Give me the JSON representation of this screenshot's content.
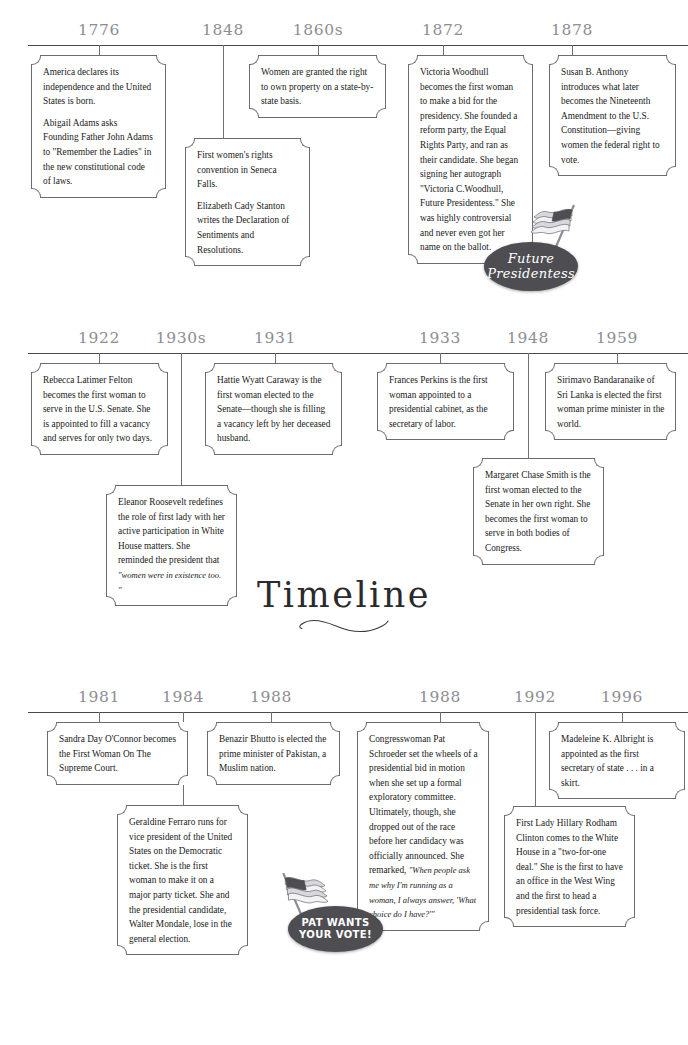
{
  "title": {
    "text": "Timeline"
  },
  "rows": [
    {
      "name": "row-1",
      "years": [
        "1776",
        "1848",
        "1860s",
        "1872",
        "1878"
      ],
      "entries": [
        {
          "name": "entry-1776",
          "paragraphs": [
            "America declares its independence and the United States is born.",
            "Abigail Adams asks Founding Father John Adams to \"Remember the Ladies\" in the new constitutional code of laws."
          ]
        },
        {
          "name": "entry-1848",
          "paragraphs": [
            "First women's rights convention in Seneca Falls.",
            "Elizabeth Cady Stanton writes the Declaration of Sentiments and Resolutions."
          ]
        },
        {
          "name": "entry-1860s",
          "paragraphs": [
            "Women are granted the right to own property on a state-by-state basis."
          ]
        },
        {
          "name": "entry-1872",
          "paragraphs": [
            "Victoria Woodhull becomes the first woman to make a bid for the presidency. She founded a reform party, the Equal Rights Party, and ran as their candidate. She began signing her autograph \"Victoria C.Woodhull, Future Presidentess.\" She was highly controversial and never even got her name on the ballot."
          ]
        },
        {
          "name": "entry-1878",
          "paragraphs": [
            "Susan B. Anthony introduces what later becomes the Nineteenth Amendment to the U.S. Constitution—giving women the federal right to vote."
          ]
        }
      ]
    },
    {
      "name": "row-2",
      "years": [
        "1922",
        "1930s",
        "1931",
        "1933",
        "1948",
        "1959"
      ],
      "entries": [
        {
          "name": "entry-1922",
          "paragraphs": [
            "Rebecca Latimer Felton becomes the first woman to serve in the U.S. Senate. She is appointed to fill a vacancy and serves for only two days."
          ]
        },
        {
          "name": "entry-1930s",
          "paragraphs": [
            "Eleanor Roosevelt redefines the role of first lady with her active participation in White House matters. She reminded the president that "
          ],
          "quote": "\"women were in existence too. \""
        },
        {
          "name": "entry-1931",
          "paragraphs": [
            "Hattie Wyatt Caraway is the first woman elected to the Senate—though she is filling a vacancy left by her deceased husband."
          ]
        },
        {
          "name": "entry-1933",
          "paragraphs": [
            "Frances Perkins is the first woman appointed to a presidential cabinet, as the secretary of labor."
          ]
        },
        {
          "name": "entry-1948",
          "paragraphs": [
            "Margaret Chase Smith is the first woman elected to the Senate in her own right. She becomes the first woman to serve in both bodies of Congress."
          ]
        },
        {
          "name": "entry-1959",
          "paragraphs": [
            "Sirimavo Bandaranaike of Sri Lanka is elected the first woman prime minister in the world."
          ]
        }
      ]
    },
    {
      "name": "row-3",
      "years": [
        "1981",
        "1984",
        "1988",
        "1988",
        "1992",
        "1996"
      ],
      "entries": [
        {
          "name": "entry-1981",
          "paragraphs": [
            "Sandra Day O'Connor becomes the First Woman On The Supreme Court."
          ]
        },
        {
          "name": "entry-1984",
          "paragraphs": [
            "Geraldine Ferraro runs for vice president of the United States on the Democratic ticket. She is the first woman to make it on a major party ticket. She and the presidential candidate, Walter Mondale, lose in the general election."
          ]
        },
        {
          "name": "entry-1988-bhutto",
          "paragraphs": [
            "Benazir Bhutto is elected the prime minister of Pakistan, a Muslim nation."
          ]
        },
        {
          "name": "entry-1988-schroeder",
          "paragraphs": [
            "Congresswoman Pat Schroeder set the wheels of a presidential bid in motion when she set up a formal exploratory committee. Ultimately, though, she dropped out of the race before her candidacy was officially announced. She remarked, "
          ],
          "quote": "\"When people ask me why I'm running as a woman, I always answer, 'What choice do I have?'\""
        },
        {
          "name": "entry-1992",
          "paragraphs": [
            "First Lady Hillary Rodham Clinton comes to the White House in a \"two-for-one deal.\" She is the first to have an office in the West Wing and the first to head a presidential task force."
          ]
        },
        {
          "name": "entry-1996",
          "paragraphs": [
            "Madeleine K. Albright is appointed as the first secretary of state . . . in a skirt."
          ]
        }
      ]
    }
  ],
  "badges": [
    {
      "name": "badge-future-presidentess",
      "line1": "Future",
      "line2": "Presidentess",
      "style": "script",
      "color": "#4e4e52"
    },
    {
      "name": "badge-pat-wants-your-vote",
      "line1": "PAT WANTS",
      "line2": "YOUR VOTE!",
      "style": "sans",
      "color": "#4e4e52"
    }
  ],
  "icons": {
    "flag": "us-flag-icon"
  }
}
